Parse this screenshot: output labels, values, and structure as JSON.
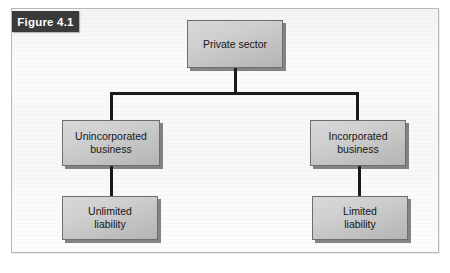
{
  "figure": {
    "label": "Figure 4.1",
    "frame_border_color": "#b9b9b9",
    "tab_background_color": "#3a3a3a",
    "tab_text_color": "#ffffff"
  },
  "diagram": {
    "type": "hierarchy-tree",
    "node_fill_color": "#c7c7c7",
    "node_border_color": "#6e6e6e",
    "connector_color": "#1a1a1a",
    "nodes": [
      {
        "id": "private-sector",
        "label": "Private sector",
        "level": 0
      },
      {
        "id": "unincorporated",
        "label": "Unincorporated\nbusiness",
        "level": 1
      },
      {
        "id": "incorporated",
        "label": "Incorporated\nbusiness",
        "level": 1
      },
      {
        "id": "unlimited",
        "label": "Unlimited\nliability",
        "level": 2
      },
      {
        "id": "limited",
        "label": "Limited\nliability",
        "level": 2
      }
    ],
    "edges": [
      {
        "from": "private-sector",
        "to": "unincorporated"
      },
      {
        "from": "private-sector",
        "to": "incorporated"
      },
      {
        "from": "unincorporated",
        "to": "unlimited"
      },
      {
        "from": "incorporated",
        "to": "limited"
      }
    ]
  }
}
